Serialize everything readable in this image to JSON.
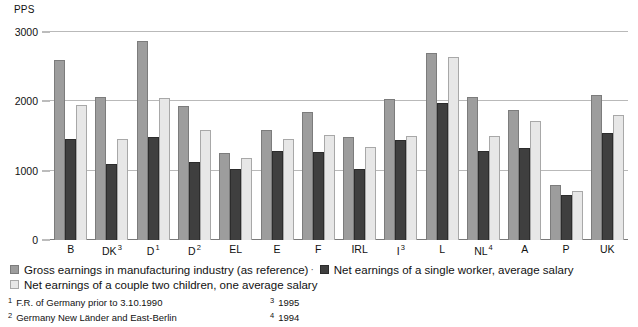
{
  "unit_label": "PPS",
  "chart_data": {
    "type": "bar",
    "title": "",
    "xlabel": "",
    "ylabel": "PPS",
    "ylim": [
      0,
      3000
    ],
    "yticks": [
      0,
      1000,
      2000,
      3000
    ],
    "grid": true,
    "legend_position": "bottom",
    "categories": [
      "B",
      "DK",
      "D",
      "D",
      "EL",
      "E",
      "F",
      "IRL",
      "I",
      "L",
      "NL",
      "A",
      "P",
      "UK"
    ],
    "category_labels": [
      {
        "label": "B",
        "note": ""
      },
      {
        "label": "DK",
        "note": "3"
      },
      {
        "label": "D",
        "note": "1"
      },
      {
        "label": "D",
        "note": "2"
      },
      {
        "label": "EL",
        "note": ""
      },
      {
        "label": "E",
        "note": ""
      },
      {
        "label": "F",
        "note": ""
      },
      {
        "label": "IRL",
        "note": ""
      },
      {
        "label": "I",
        "note": "3"
      },
      {
        "label": "L",
        "note": ""
      },
      {
        "label": "NL",
        "note": "4"
      },
      {
        "label": "A",
        "note": ""
      },
      {
        "label": "P",
        "note": ""
      },
      {
        "label": "UK",
        "note": ""
      }
    ],
    "series": [
      {
        "name": "Gross earnings in manufacturing industry (as reference)",
        "color": "#9d9d9d",
        "values": [
          2600,
          2060,
          2870,
          1930,
          1250,
          1590,
          1840,
          1480,
          2030,
          2700,
          2060,
          1880,
          790,
          2090
        ]
      },
      {
        "name": "Net earnings of a single worker, average salary",
        "color": "#3f3f3f",
        "values": [
          1450,
          1090,
          1490,
          1120,
          1030,
          1280,
          1270,
          1030,
          1440,
          1980,
          1290,
          1320,
          650,
          1540
        ]
      },
      {
        "name": "Net earnings of a couple two children, one average salary",
        "color": "#e7e7e7",
        "values": [
          1950,
          1450,
          2050,
          1590,
          1190,
          1460,
          1520,
          1340,
          1500,
          2640,
          1500,
          1720,
          700,
          1800
        ]
      }
    ]
  },
  "legend": {
    "gross_label": "Gross earnings in manufacturing industry (as reference)",
    "single_label": "Net earnings of a single worker, average salary",
    "couple_label": "Net earnings of a couple two children, one average salary",
    "separator": "·"
  },
  "footnotes": [
    {
      "mark": "1",
      "text": "F.R. of Germany prior to 3.10.1990"
    },
    {
      "mark": "2",
      "text": "Germany New Länder and East-Berlin"
    },
    {
      "mark": "3",
      "text": "1995"
    },
    {
      "mark": "4",
      "text": "1994"
    }
  ]
}
